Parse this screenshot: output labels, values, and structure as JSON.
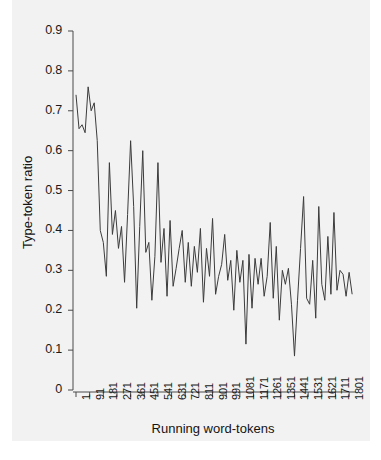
{
  "chart_data": {
    "type": "line",
    "title": "",
    "xlabel": "Running word-tokens",
    "ylabel": "Type-token ratio",
    "xlim": [
      1,
      1820
    ],
    "ylim": [
      0,
      0.9
    ],
    "grid": false,
    "legend": null,
    "line_color": "#3c3c3c",
    "panel_color": "#f2f2f2",
    "x_tick_labels": [
      "1",
      "91",
      "181",
      "271",
      "361",
      "451",
      "541",
      "631",
      "721",
      "811",
      "901",
      "991",
      "1081",
      "1171",
      "1261",
      "1351",
      "1441",
      "1531",
      "1621",
      "1711",
      "1801"
    ],
    "x_tick_values": [
      1,
      91,
      181,
      271,
      361,
      451,
      541,
      631,
      721,
      811,
      901,
      991,
      1081,
      1171,
      1261,
      1351,
      1441,
      1531,
      1621,
      1711,
      1801
    ],
    "y_tick_labels": [
      "0",
      "0.1",
      "0.2",
      "0.3",
      "0.4",
      "0.5",
      "0.6",
      "0.7",
      "0.8",
      "0.9"
    ],
    "y_tick_values": [
      0,
      0.1,
      0.2,
      0.3,
      0.4,
      0.5,
      0.6,
      0.7,
      0.8,
      0.9
    ],
    "x": [
      1,
      21,
      41,
      61,
      81,
      101,
      121,
      141,
      161,
      181,
      201,
      221,
      241,
      261,
      281,
      301,
      321,
      341,
      361,
      381,
      401,
      421,
      441,
      461,
      481,
      501,
      521,
      541,
      561,
      581,
      601,
      621,
      641,
      661,
      681,
      701,
      721,
      741,
      761,
      781,
      801,
      821,
      841,
      861,
      881,
      901,
      921,
      941,
      961,
      981,
      1001,
      1021,
      1041,
      1061,
      1081,
      1101,
      1121,
      1141,
      1161,
      1181,
      1201,
      1221,
      1241,
      1261,
      1281,
      1301,
      1321,
      1341,
      1361,
      1381,
      1401,
      1421,
      1441,
      1461,
      1481,
      1501,
      1521,
      1541,
      1561,
      1581,
      1601,
      1621,
      1641,
      1661,
      1681,
      1701,
      1721,
      1741,
      1761,
      1781,
      1801,
      1821
    ],
    "values": [
      0.74,
      0.655,
      0.665,
      0.645,
      0.76,
      0.7,
      0.72,
      0.625,
      0.4,
      0.37,
      0.285,
      0.57,
      0.39,
      0.45,
      0.355,
      0.41,
      0.27,
      0.44,
      0.625,
      0.46,
      0.205,
      0.41,
      0.6,
      0.345,
      0.37,
      0.225,
      0.335,
      0.57,
      0.32,
      0.405,
      0.235,
      0.425,
      0.26,
      0.305,
      0.355,
      0.4,
      0.27,
      0.37,
      0.26,
      0.36,
      0.295,
      0.405,
      0.22,
      0.355,
      0.285,
      0.43,
      0.24,
      0.285,
      0.315,
      0.39,
      0.275,
      0.325,
      0.2,
      0.35,
      0.27,
      0.325,
      0.115,
      0.34,
      0.205,
      0.33,
      0.265,
      0.33,
      0.235,
      0.285,
      0.42,
      0.23,
      0.36,
      0.175,
      0.3,
      0.265,
      0.305,
      0.215,
      0.085,
      0.225,
      0.355,
      0.485,
      0.23,
      0.215,
      0.325,
      0.18,
      0.46,
      0.265,
      0.225,
      0.385,
      0.24,
      0.445,
      0.25,
      0.3,
      0.29,
      0.235,
      0.295,
      0.24
    ]
  }
}
